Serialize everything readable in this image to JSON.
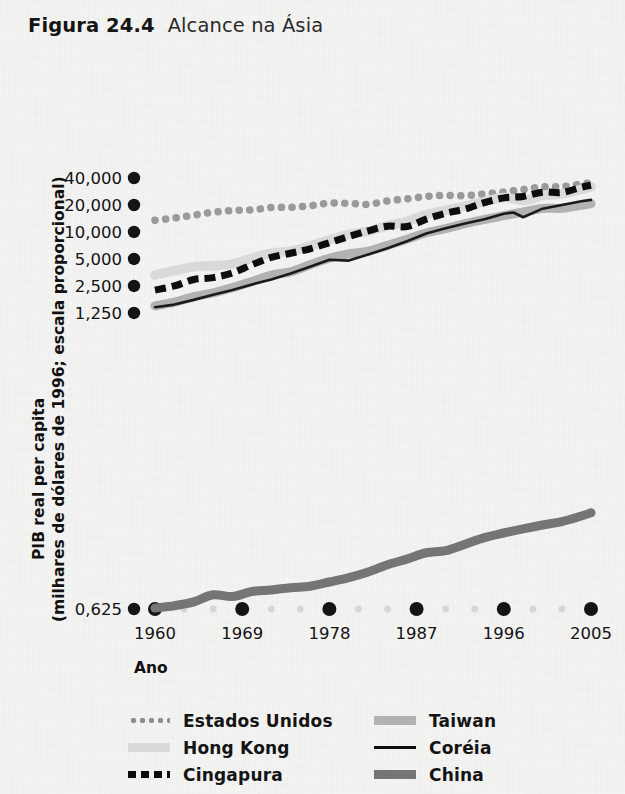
{
  "header": {
    "figure_number": "Figura 24.4",
    "figure_title": "Alcance na Ásia"
  },
  "chart_data": {
    "type": "line",
    "title": "Alcance na Ásia",
    "xlabel": "Ano",
    "ylabel": "PIB real per capita (milhares de dólares de 1996; escala proporcional)",
    "ylabel_line1": "PIB real per capita",
    "ylabel_line2": "(milhares de dólares de 1996; escala proporcional)",
    "yscale": "log2",
    "ylim": [
      0.625,
      48000
    ],
    "xlim": [
      1960,
      2006
    ],
    "grid": false,
    "legend_position": "bottom",
    "ytick_labels": [
      "40,000",
      "20,000",
      "10,000",
      "5,000",
      "2,500",
      "1,250",
      "0,625"
    ],
    "ytick_values": [
      40000,
      20000,
      10000,
      5000,
      2500,
      1250,
      0.625
    ],
    "xtick_labels": [
      "1960",
      "1969",
      "1978",
      "1987",
      "1996",
      "2005"
    ],
    "xtick_values": [
      1960,
      1969,
      1978,
      1987,
      1996,
      2005
    ],
    "series": [
      {
        "name": "Estados Unidos",
        "style": "dotted",
        "color": "#9a9a9a",
        "x": [
          1960,
          1962,
          1964,
          1966,
          1968,
          1970,
          1972,
          1974,
          1976,
          1978,
          1980,
          1982,
          1984,
          1986,
          1988,
          1990,
          1992,
          1994,
          1996,
          1998,
          2000,
          2002,
          2004,
          2005
        ],
        "values": [
          13500,
          14300,
          15400,
          16600,
          17400,
          17600,
          18800,
          18800,
          19600,
          21000,
          20900,
          20300,
          22200,
          23400,
          24900,
          25600,
          25400,
          26600,
          27900,
          29800,
          31800,
          32100,
          34300,
          35400
        ]
      },
      {
        "name": "Hong Kong",
        "style": "thick-light",
        "color": "#d9d9d9",
        "x": [
          1960,
          1962,
          1964,
          1966,
          1968,
          1970,
          1972,
          1974,
          1976,
          1978,
          1980,
          1982,
          1984,
          1986,
          1988,
          1990,
          1992,
          1994,
          1996,
          1998,
          2000,
          2002,
          2004,
          2005
        ],
        "values": [
          3300,
          3700,
          4100,
          4200,
          4400,
          5100,
          5800,
          6100,
          7000,
          8200,
          9400,
          10200,
          11800,
          13100,
          15600,
          17400,
          19400,
          21800,
          24300,
          22400,
          25400,
          26600,
          29900,
          31800
        ]
      },
      {
        "name": "Cingapura",
        "style": "dashed",
        "color": "#0d0d0d",
        "x": [
          1960,
          1962,
          1964,
          1966,
          1968,
          1970,
          1972,
          1974,
          1976,
          1978,
          1980,
          1982,
          1984,
          1986,
          1988,
          1990,
          1992,
          1994,
          1996,
          1998,
          2000,
          2002,
          2004,
          2005
        ],
        "values": [
          2250,
          2500,
          2950,
          3100,
          3500,
          4300,
          5200,
          5800,
          6500,
          7600,
          8900,
          10300,
          11600,
          11500,
          13900,
          16200,
          18000,
          21300,
          24000,
          24900,
          27800,
          27600,
          31600,
          33200
        ]
      },
      {
        "name": "Taiwan",
        "style": "thick-gray",
        "color": "#b2b2b2",
        "x": [
          1960,
          1962,
          1964,
          1966,
          1968,
          1970,
          1972,
          1974,
          1976,
          1978,
          1980,
          1982,
          1984,
          1986,
          1988,
          1990,
          1992,
          1994,
          1996,
          1998,
          2000,
          2002,
          2004,
          2005
        ],
        "values": [
          1500,
          1650,
          1900,
          2100,
          2400,
          2800,
          3300,
          3600,
          4300,
          5100,
          5700,
          6100,
          7100,
          8300,
          9800,
          10900,
          12400,
          13800,
          15200,
          16700,
          18300,
          18400,
          19800,
          20700
        ]
      },
      {
        "name": "Coréia",
        "style": "thin-black",
        "color": "#1a1a1a",
        "x": [
          1960,
          1962,
          1964,
          1966,
          1968,
          1970,
          1972,
          1974,
          1976,
          1978,
          1980,
          1982,
          1984,
          1986,
          1988,
          1990,
          1992,
          1994,
          1996,
          1997,
          1998,
          2000,
          2002,
          2004,
          2005
        ],
        "values": [
          1450,
          1550,
          1750,
          2000,
          2250,
          2600,
          2950,
          3450,
          4100,
          4900,
          4800,
          5600,
          6600,
          7900,
          9600,
          11000,
          12400,
          13900,
          16000,
          16500,
          14600,
          18200,
          20000,
          22000,
          22800
        ]
      },
      {
        "name": "China",
        "style": "thick-dark",
        "color": "#757575",
        "x": [
          1960,
          1962,
          1964,
          1966,
          1968,
          1970,
          1972,
          1974,
          1976,
          1978,
          1980,
          1982,
          1984,
          1986,
          1988,
          1990,
          1992,
          1994,
          1996,
          1998,
          2000,
          2002,
          2004,
          2005
        ],
        "values": [
          0.64,
          0.68,
          0.75,
          0.9,
          0.86,
          0.98,
          1.02,
          1.08,
          1.12,
          1.25,
          1.4,
          1.62,
          1.95,
          2.25,
          2.65,
          2.8,
          3.3,
          3.9,
          4.4,
          4.9,
          5.4,
          5.9,
          6.8,
          7.4
        ]
      }
    ]
  },
  "axes": {
    "x_axis_title": "Ano"
  },
  "legend": {
    "items": [
      {
        "label": "Estados Unidos",
        "swatch": "dotted-line-swatch"
      },
      {
        "label": "Taiwan",
        "swatch": "thick-gray-line-swatch"
      },
      {
        "label": "Hong Kong",
        "swatch": "thick-light-line-swatch"
      },
      {
        "label": "Coréia",
        "swatch": "thin-black-line-swatch"
      },
      {
        "label": "Cingapura",
        "swatch": "dashed-line-swatch"
      },
      {
        "label": "China",
        "swatch": "thick-dark-line-swatch"
      }
    ]
  },
  "colors": {
    "background": "#f4f4f3",
    "ink": "#141414",
    "estados_unidos": "#9a9a9a",
    "hong_kong": "#d9d9d9",
    "cingapura": "#0d0d0d",
    "taiwan": "#b2b2b2",
    "coreia": "#1a1a1a",
    "china": "#757575"
  }
}
